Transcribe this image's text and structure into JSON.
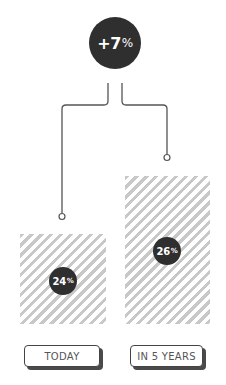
{
  "header": {
    "change_value": "+7",
    "change_unit": "%"
  },
  "bars": [
    {
      "label": "TODAY",
      "value": "24",
      "unit": "%"
    },
    {
      "label": "IN 5 YEARS",
      "value": "26",
      "unit": "%"
    }
  ],
  "colors": {
    "circle": "#2f2f2f",
    "stripe": "#c8c8c8",
    "line": "#555555"
  }
}
